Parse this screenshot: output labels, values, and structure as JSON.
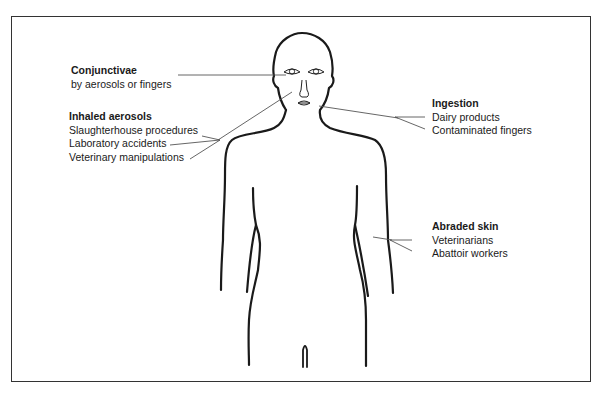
{
  "diagram": {
    "type": "human-body-exposure-routes",
    "labels": [
      {
        "id": "conjunctivae",
        "title": "Conjunctivae",
        "items": [
          "by aerosols or fingers"
        ],
        "target": "eyes"
      },
      {
        "id": "inhaled-aerosols",
        "title": "Inhaled aerosols",
        "items": [
          "Slaughterhouse procedures",
          "Laboratory accidents",
          "Veterinary manipulations"
        ],
        "target": "nose"
      },
      {
        "id": "ingestion",
        "title": "Ingestion",
        "items": [
          "Dairy products",
          "Contaminated fingers"
        ],
        "target": "mouth"
      },
      {
        "id": "abraded-skin",
        "title": "Abraded skin",
        "items": [
          "Veterinarians",
          "Abattoir workers"
        ],
        "target": "arm"
      }
    ],
    "colors": {
      "outline": "#1a1a1a",
      "leader_line": "#555555",
      "frame": "#333333",
      "background": "#ffffff"
    }
  }
}
